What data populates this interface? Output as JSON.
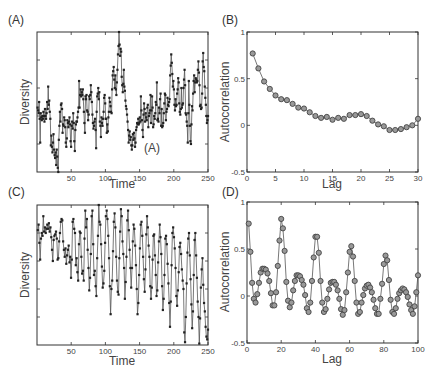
{
  "chart_data": [
    {
      "id": "A",
      "panel_label": "(A)",
      "type": "line",
      "marker": "square",
      "xlabel": "Time",
      "ylabel": "Diversity",
      "xlim": [
        0,
        250
      ],
      "xticks": [
        50,
        100,
        150,
        200,
        250
      ],
      "ylim": [
        0,
        10
      ],
      "yticks_unlabeled": [
        2,
        4,
        6,
        8
      ],
      "annotation": "(A)",
      "box": {
        "x": 37,
        "y": 32,
        "w": 171,
        "h": 140
      },
      "values": [
        4.6,
        4.4,
        4.2,
        5.0,
        3.8,
        2.1,
        4.2,
        3.9,
        3.7,
        4.0,
        3.8,
        4.3,
        4.0,
        3.6,
        4.5,
        4.0,
        3.8,
        4.2,
        5.0,
        4.5,
        6.1,
        4.8,
        5.1,
        4.3,
        3.8,
        1.9,
        2.6,
        1.8,
        1.4,
        2.1,
        2.7,
        1.6,
        1.2,
        1.0,
        1.4,
        0.5,
        1.6,
        1.1,
        0.3,
        0.0,
        2.3,
        3.3,
        4.3,
        3.6,
        4.8,
        4.9,
        4.5,
        2.8,
        3.4,
        3.3,
        3.9,
        3.7,
        3.2,
        2.1,
        1.8,
        2.4,
        3.7,
        3.5,
        3.2,
        3.6,
        3.9,
        3.4,
        2.2,
        1.8,
        3.3,
        3.6,
        3.1,
        4.2,
        3.5,
        2.2,
        1.5,
        3.0,
        3.4,
        3.6,
        3.6,
        3.9,
        4.3,
        4.6,
        6.5,
        4.6,
        5.5,
        5.9,
        5.4,
        5.7,
        5.5,
        5.9,
        5.2,
        4.3,
        3.5,
        2.8,
        5.4,
        5.2,
        5.5,
        4.4,
        4.3,
        3.7,
        4.1,
        5.4,
        5.2,
        5.5,
        6.2,
        5.7,
        5.0,
        4.1,
        3.5,
        3.1,
        3.3,
        3.6,
        3.8,
        3.0,
        1.7,
        4.3,
        5.4,
        5.6,
        6.0,
        5.2,
        5.7,
        3.6,
        3.3,
        2.5,
        3.9,
        3.5,
        3.3,
        3.8,
        4.3,
        5.3,
        5.5,
        4.9,
        3.8,
        3.8,
        2.8,
        3.4,
        2.9,
        3.9,
        4.3,
        5.3,
        5.0,
        4.7,
        4.3,
        4.2,
        5.9,
        6.9,
        7.2,
        7.5,
        6.6,
        6.0,
        6.9,
        5.9,
        5.5,
        6.4,
        7.3,
        8.4,
        9.0,
        10.0,
        9.1,
        8.3,
        8.8,
        8.6,
        6.8,
        6.2,
        5.7,
        6.3,
        7.3,
        6.1,
        5.8,
        5.1,
        4.7,
        4.5,
        4.1,
        3.6,
        3.0,
        2.1,
        2.6,
        2.9,
        2.3,
        2.5,
        1.9,
        1.6,
        1.9,
        2.7,
        2.3,
        2.8,
        2.4,
        1.8,
        2.1,
        3.0,
        3.2,
        3.5,
        3.4,
        3.8,
        3.4,
        3.5,
        3.9,
        3.6,
        5.4,
        4.4,
        3.7,
        3.0,
        2.5,
        4.1,
        4.9,
        4.5,
        3.6,
        4.2,
        3.9,
        3.7,
        4.6,
        4.8,
        3.2,
        4.0,
        4.2,
        4.4,
        5.5,
        3.5,
        4.4,
        5.4,
        4.6,
        3.2,
        3.4,
        4.0,
        3.8,
        4.2,
        5.0,
        4.8,
        6.4,
        3.7,
        3.8,
        3.6,
        4.6,
        4.2,
        5.2,
        5.6,
        3.3,
        4.5,
        3.2,
        3.3,
        3.5,
        4.2,
        4.9,
        5.6,
        5.5,
        3.7,
        4.3,
        4.5,
        5.3,
        4.8,
        4.7,
        5.0,
        5.2,
        6.9,
        7.6,
        8.4,
        7.8,
        7.0,
        6.1,
        6.5,
        5.9,
        4.8,
        4.4,
        5.2,
        4.7,
        4.8,
        5.6,
        5.9,
        6.7,
        6.4,
        4.9,
        4.3,
        4.1,
        4.5,
        6.0,
        4.6,
        4.8,
        4.9,
        6.0,
        6.6,
        7.3,
        6.2,
        4.2,
        4.1,
        3.6,
        3.3,
        2.1,
        4.2,
        6.5,
        4.8,
        3.3,
        2.2,
        2.0,
        3.4,
        4.7,
        4.4,
        5.6,
        6.5,
        6.9,
        5.7,
        6.4,
        6.7,
        6.6,
        6.4,
        6.5,
        7.3,
        7.9,
        7.1,
        6.2,
        4.7,
        4.8,
        4.5,
        4.6,
        5.6,
        7.9,
        8.5,
        7.5,
        7.2,
        6.1,
        5.3,
        4.8,
        4.0,
        3.5,
        3.7,
        4.0
      ]
    },
    {
      "id": "B",
      "panel_label": "(B)",
      "type": "line",
      "marker": "circle",
      "xlabel": "Lag",
      "ylabel": "Autocorrelation",
      "xlim": [
        0,
        30
      ],
      "ylim": [
        -0.5,
        1
      ],
      "xticks": [
        0,
        5,
        10,
        15,
        20,
        25,
        30
      ],
      "yticks": [
        -0.5,
        0,
        0.5,
        1
      ],
      "ytick_labels": [
        "-0.5",
        "0",
        "0.5",
        "1"
      ],
      "box": {
        "x": 247,
        "y": 32,
        "w": 171,
        "h": 140
      },
      "x": [
        1,
        2,
        3,
        4,
        5,
        6,
        7,
        8,
        9,
        10,
        11,
        12,
        13,
        14,
        15,
        16,
        17,
        18,
        19,
        20,
        21,
        22,
        23,
        24,
        25,
        26,
        27,
        28,
        29,
        30
      ],
      "values": [
        0.77,
        0.61,
        0.47,
        0.39,
        0.32,
        0.28,
        0.27,
        0.23,
        0.19,
        0.18,
        0.14,
        0.1,
        0.08,
        0.09,
        0.06,
        0.08,
        0.07,
        0.11,
        0.11,
        0.12,
        0.1,
        0.05,
        0.01,
        -0.01,
        -0.05,
        -0.05,
        -0.04,
        -0.02,
        0.0,
        0.07
      ]
    },
    {
      "id": "C",
      "panel_label": "(C)",
      "type": "line",
      "marker": "square",
      "xlabel": "Time",
      "ylabel": "Diversity",
      "xlim": [
        0,
        250
      ],
      "xticks": [
        50,
        100,
        150,
        200,
        250
      ],
      "ylim": [
        0,
        10
      ],
      "yticks_unlabeled": [
        2,
        4,
        6,
        8
      ],
      "box": {
        "x": 37,
        "y": 205,
        "w": 171,
        "h": 140
      },
      "values": [
        8.2,
        8.6,
        7.3,
        6.1,
        7.6,
        8.0,
        7.8,
        9.2,
        8.1,
        8.4,
        8.0,
        8.3,
        8.6,
        8.3,
        8.7,
        8.1,
        8.4,
        7.7,
        6.8,
        6.0,
        7.5,
        7.8,
        7.9,
        8.1,
        7.6,
        6.1,
        6.2,
        7.4,
        8.0,
        8.8,
        9.0,
        8.9,
        7.4,
        6.8,
        6.3,
        6.9,
        5.8,
        6.4,
        6.8,
        7.1,
        5.9,
        6.3,
        4.8,
        6.1,
        8.8,
        9.0,
        8.3,
        8.0,
        5.7,
        6.2,
        5.2,
        4.6,
        7.2,
        8.1,
        8.0,
        6.3,
        5.1,
        5.3,
        4.6,
        7.6,
        9.6,
        8.4,
        9.0,
        6.8,
        5.5,
        3.9,
        4.8,
        6.5,
        9.2,
        9.6,
        7.2,
        5.0,
        5.3,
        4.2,
        3.5,
        6.2,
        7.8,
        10.0,
        8.8,
        8.6,
        7.2,
        5.6,
        4.1,
        4.4,
        5.3,
        7.3,
        9.2,
        9.6,
        9.0,
        7.8,
        6.2,
        4.2,
        2.2,
        4.0,
        4.6,
        6.7,
        8.8,
        9.4,
        8.4,
        6.3,
        4.6,
        3.8,
        3.6,
        6.2,
        8.1,
        9.7,
        9.2,
        7.4,
        6.5,
        5.5,
        3.3,
        4.5,
        6.3,
        8.9,
        9.6,
        8.2,
        6.8,
        5.5,
        4.1,
        5.5,
        7.4,
        8.6,
        8.3,
        7.1,
        5.7,
        4.0,
        2.2,
        3.0,
        5.0,
        6.9,
        8.6,
        8.8,
        7.8,
        6.3,
        4.7,
        3.8,
        5.4,
        7.9,
        9.2,
        8.4,
        7.1,
        6.3,
        4.2,
        3.3,
        4.1,
        6.1,
        7.8,
        7.9,
        6.4,
        5.0,
        3.5,
        3.9,
        5.9,
        7.4,
        8.6,
        7.7,
        6.5,
        4.2,
        2.5,
        3.3,
        5.0,
        7.6,
        7.8,
        7.2,
        5.8,
        4.4,
        3.0,
        1.3,
        3.1,
        5.7,
        8.0,
        8.4,
        7.7,
        6.9,
        5.5,
        3.5,
        2.8,
        3.9,
        5.2,
        7.0,
        7.3,
        6.5,
        5.4,
        4.6,
        4.0,
        0.9,
        0.2,
        2.0,
        4.4,
        6.6,
        7.6,
        8.0,
        6.4,
        4.7,
        2.9,
        1.2,
        2.4,
        5.0,
        7.5,
        8.0,
        6.4,
        4.8,
        3.1,
        2.0,
        0.1,
        1.9,
        4.1,
        5.4,
        6.2,
        4.3,
        3.0,
        2.4,
        1.3,
        0.6,
        0.4,
        1.1
      ]
    },
    {
      "id": "D",
      "panel_label": "(D)",
      "type": "line",
      "marker": "circle",
      "xlabel": "Lag",
      "ylabel": "Autocorrelation",
      "xlim": [
        0,
        100
      ],
      "ylim": [
        -0.5,
        1
      ],
      "xticks": [
        0,
        20,
        40,
        60,
        80,
        100
      ],
      "yticks": [
        -0.5,
        0,
        0.5,
        1
      ],
      "ytick_labels": [
        "-0.5",
        "0",
        "0.5",
        "1"
      ],
      "box": {
        "x": 247,
        "y": 202,
        "w": 171,
        "h": 141
      },
      "x": [
        1,
        2,
        3,
        4,
        5,
        6,
        7,
        8,
        9,
        10,
        11,
        12,
        13,
        14,
        15,
        16,
        17,
        18,
        19,
        20,
        21,
        22,
        23,
        24,
        25,
        26,
        27,
        28,
        29,
        30,
        31,
        32,
        33,
        34,
        35,
        36,
        37,
        38,
        39,
        40,
        41,
        42,
        43,
        44,
        45,
        46,
        47,
        48,
        49,
        50,
        51,
        52,
        53,
        54,
        55,
        56,
        57,
        58,
        59,
        60,
        61,
        62,
        63,
        64,
        65,
        66,
        67,
        68,
        69,
        70,
        71,
        72,
        73,
        74,
        75,
        76,
        77,
        78,
        79,
        80,
        81,
        82,
        83,
        84,
        85,
        86,
        87,
        88,
        89,
        90,
        91,
        92,
        93,
        94,
        95,
        96,
        97,
        98,
        99,
        100
      ],
      "values": [
        0.77,
        0.47,
        0.14,
        -0.03,
        -0.07,
        0.02,
        0.14,
        0.25,
        0.29,
        0.29,
        0.28,
        0.24,
        0.16,
        0.03,
        -0.1,
        -0.1,
        0.04,
        0.32,
        0.59,
        0.82,
        0.72,
        0.48,
        0.15,
        -0.05,
        -0.12,
        -0.07,
        0.06,
        0.16,
        0.22,
        0.22,
        0.21,
        0.17,
        0.12,
        0.01,
        -0.13,
        -0.17,
        -0.07,
        0.16,
        0.41,
        0.63,
        0.63,
        0.46,
        0.16,
        -0.07,
        -0.17,
        -0.14,
        -0.03,
        0.07,
        0.14,
        0.15,
        0.15,
        0.12,
        0.06,
        -0.03,
        -0.14,
        -0.2,
        -0.15,
        0.04,
        0.25,
        0.47,
        0.53,
        0.42,
        0.16,
        -0.07,
        -0.19,
        -0.17,
        -0.07,
        0.01,
        0.08,
        0.11,
        0.12,
        0.09,
        0.04,
        -0.04,
        -0.13,
        -0.19,
        -0.19,
        -0.03,
        0.13,
        0.34,
        0.43,
        0.38,
        0.17,
        -0.04,
        -0.17,
        -0.19,
        -0.13,
        -0.03,
        0.03,
        0.06,
        0.08,
        0.07,
        0.04,
        -0.01,
        -0.09,
        -0.15,
        -0.19,
        -0.11,
        0.04,
        0.22
      ]
    }
  ]
}
